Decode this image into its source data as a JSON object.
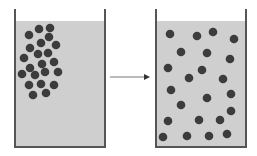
{
  "diagram": {
    "colors": {
      "background": "#ffffff",
      "liquid": "#cfcfcf",
      "wall": "#555555",
      "particle": "#3c3c3c",
      "arrow": "#777777"
    },
    "particle_radius": 4.3,
    "left_beaker": {
      "label": "before",
      "x": 15,
      "y": 9,
      "width": 90,
      "height": 138,
      "liquid_top": 21,
      "particles": [
        [
          50,
          28
        ],
        [
          39,
          29
        ],
        [
          29,
          35
        ],
        [
          49,
          37
        ],
        [
          41,
          43
        ],
        [
          56,
          45
        ],
        [
          30,
          48
        ],
        [
          38,
          54
        ],
        [
          48,
          53
        ],
        [
          24,
          58
        ],
        [
          54,
          62
        ],
        [
          42,
          64
        ],
        [
          30,
          68
        ],
        [
          22,
          74
        ],
        [
          35,
          75
        ],
        [
          45,
          72
        ],
        [
          58,
          72
        ],
        [
          29,
          85
        ],
        [
          41,
          84
        ],
        [
          54,
          85
        ],
        [
          33,
          95
        ],
        [
          46,
          93
        ]
      ]
    },
    "arrow": {
      "x1": 110,
      "y": 77,
      "x2": 150
    },
    "right_beaker": {
      "label": "after",
      "x": 156,
      "y": 9,
      "width": 90,
      "height": 138,
      "liquid_top": 21,
      "particles": [
        [
          170,
          34
        ],
        [
          197,
          36
        ],
        [
          213,
          32
        ],
        [
          234,
          39
        ],
        [
          181,
          52
        ],
        [
          207,
          53
        ],
        [
          230,
          59
        ],
        [
          168,
          68
        ],
        [
          202,
          70
        ],
        [
          189,
          78
        ],
        [
          223,
          79
        ],
        [
          171,
          90
        ],
        [
          207,
          98
        ],
        [
          231,
          94
        ],
        [
          181,
          105
        ],
        [
          231,
          111
        ],
        [
          168,
          121
        ],
        [
          199,
          120
        ],
        [
          220,
          120
        ],
        [
          163,
          137
        ],
        [
          187,
          136
        ],
        [
          209,
          136
        ],
        [
          227,
          134
        ]
      ]
    }
  }
}
